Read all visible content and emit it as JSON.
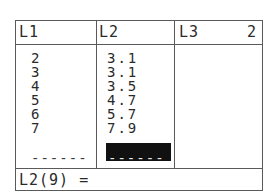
{
  "list_editor": {
    "headers": [
      {
        "label": "L1"
      },
      {
        "label": "L2"
      },
      {
        "label": "L3"
      }
    ],
    "column_index_indicator": "2",
    "columns": {
      "L1": [
        "2",
        "3",
        "4",
        "5",
        "6",
        "7"
      ],
      "L2": [
        "3.1",
        "3.1",
        "3.5",
        "4.7",
        "5.7",
        "7.9"
      ],
      "L3": []
    },
    "L1_end_marker": "------",
    "L2_cursor_marker": "------",
    "entry_line": "L2(9) =",
    "colors": {
      "border": "#5a5a5a",
      "text": "#2a2a2a",
      "cursor": "#111111",
      "background": "#ffffff"
    }
  }
}
